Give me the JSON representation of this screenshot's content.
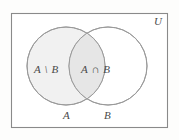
{
  "figure": {
    "background_color": "#fdfdfc",
    "universe": {
      "label": "U",
      "border_color": "#8a8a8a",
      "fill_color": "#ffffff",
      "x": 11,
      "y": 13,
      "width": 157,
      "height": 115
    },
    "circles": [
      {
        "name": "set-a",
        "label": "A",
        "cx": 66,
        "cy": 66,
        "r": 39,
        "fill_color": "#f1f1f1",
        "stroke_color": "#9a9a9a"
      },
      {
        "name": "set-b",
        "label": "B",
        "cx": 108,
        "cy": 66,
        "r": 39,
        "fill_color": "#ffffff",
        "stroke_color": "#9a9a9a"
      }
    ],
    "intersection": {
      "name": "a-intersect-b",
      "label": "A ∩ B",
      "fill_color": "#e6e6e6"
    },
    "regions": [
      {
        "name": "a-minus-b",
        "label": "A \\ B"
      },
      {
        "name": "a-intersect-b",
        "label": "A ∩ B"
      }
    ],
    "set_labels": [
      {
        "name": "set-label-a",
        "label": "A"
      },
      {
        "name": "set-label-b",
        "label": "B"
      }
    ]
  }
}
